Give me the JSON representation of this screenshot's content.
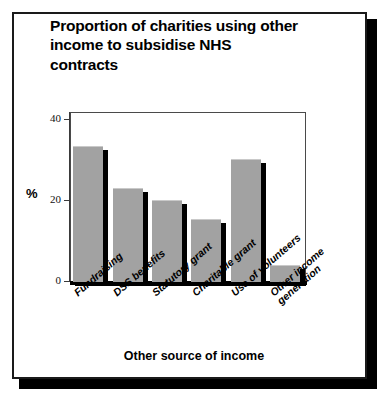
{
  "chart_data": {
    "type": "bar",
    "title": "Proportion of charities using other\nincome to subsidise NHS\ncontracts",
    "xlabel": "Other source of income",
    "ylabel": "%",
    "categories": [
      "Fundraising",
      "DSS benefits",
      "Statutory grant",
      "Charitable grant",
      "Use of volunteers",
      "Other income\ngeneration"
    ],
    "values": [
      33.5,
      23.2,
      20.2,
      15.5,
      30.5,
      4.2
    ],
    "ylim": [
      0,
      42
    ],
    "yticks": [
      0,
      20,
      40
    ],
    "ytick_labels": [
      "0",
      "20",
      "40"
    ],
    "grid": false,
    "legend": "none",
    "bar_color": "#a2a2a2",
    "shadow_color": "#000000"
  },
  "figure": {
    "frame_border_color": "#1a1a1a",
    "background_color": "#ffffff"
  }
}
